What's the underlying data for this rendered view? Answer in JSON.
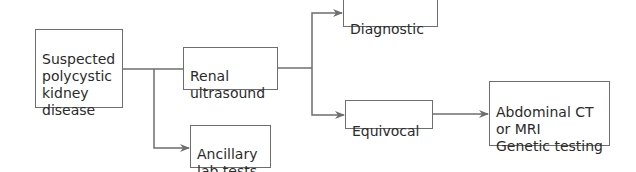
{
  "diagram": {
    "title": "",
    "nodes": [
      {
        "id": "suspected",
        "label": "Suspected\npolycystic\nkidney\ndisease"
      },
      {
        "id": "renal",
        "label": "Renal\nultrasound"
      },
      {
        "id": "ancillary",
        "label": "Ancillary\nlab tests"
      },
      {
        "id": "diagnostic",
        "label": "Diagnostic"
      },
      {
        "id": "equivocal",
        "label": "Equivocal"
      },
      {
        "id": "followup",
        "label": "Abdominal CT\nor MRI\nGenetic testing"
      }
    ],
    "edges": [
      {
        "from": "suspected",
        "to": "renal"
      },
      {
        "from": "suspected",
        "to": "ancillary"
      },
      {
        "from": "renal",
        "to": "diagnostic"
      },
      {
        "from": "renal",
        "to": "equivocal"
      },
      {
        "from": "equivocal",
        "to": "followup"
      }
    ],
    "colors": {
      "line": "#6e6e6e",
      "text": "#2b2b2b",
      "background": "#ffffff"
    }
  }
}
